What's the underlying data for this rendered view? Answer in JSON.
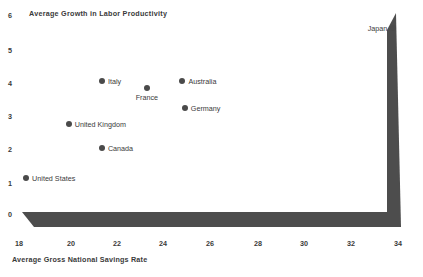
{
  "chart_data": {
    "type": "scatter",
    "title": "Average Growth in Labor Productivity",
    "xlabel": "Average Gross National Savings Rate",
    "ylabel": "Average Growth in Labor Productivity",
    "xlim": [
      18,
      34
    ],
    "ylim": [
      0,
      6
    ],
    "xticks": [
      18,
      20,
      22,
      24,
      26,
      28,
      30,
      32,
      34
    ],
    "yticks": [
      0,
      1,
      2,
      3,
      4,
      5,
      6
    ],
    "grid": false,
    "legend": "none",
    "marker_color": "#4a4a4a",
    "axis_color": "#4d4d4d",
    "points": [
      {
        "label": "Japan",
        "x": 33.8,
        "y": 5.6,
        "label_pos": "left"
      },
      {
        "label": "Italy",
        "x": 21.5,
        "y": 4.0,
        "label_pos": "right"
      },
      {
        "label": "Australia",
        "x": 24.9,
        "y": 4.0,
        "label_pos": "right"
      },
      {
        "label": "France",
        "x": 23.4,
        "y": 3.8,
        "label_pos": "below"
      },
      {
        "label": "Germany",
        "x": 25.0,
        "y": 3.2,
        "label_pos": "right"
      },
      {
        "label": "United Kingdom",
        "x": 20.1,
        "y": 2.7,
        "label_pos": "right"
      },
      {
        "label": "Canada",
        "x": 21.5,
        "y": 2.0,
        "label_pos": "right"
      },
      {
        "label": "United States",
        "x": 18.3,
        "y": 1.1,
        "label_pos": "right"
      }
    ]
  }
}
